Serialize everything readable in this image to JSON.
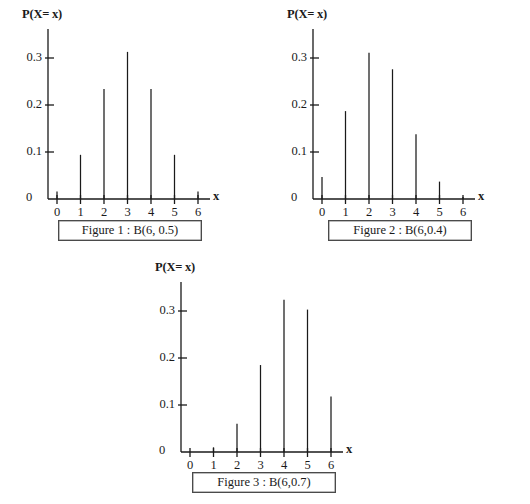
{
  "page": {
    "width": 530,
    "height": 504,
    "background": "#ffffff",
    "ink_color": "#1a1a1a"
  },
  "axis_common": {
    "y_axis_title": "P(X= x)",
    "x_axis_title": "x",
    "origin_label": "0",
    "y_tick_labels": [
      "0.1",
      "0.2",
      "0.3"
    ],
    "y_tick_values": [
      0.1,
      0.2,
      0.3
    ],
    "x_tick_labels": [
      "0",
      "1",
      "2",
      "3",
      "4",
      "5",
      "6"
    ],
    "ylim": [
      0,
      0.355
    ],
    "xlim": [
      -0.55,
      6.8
    ]
  },
  "figures": [
    {
      "id": "figure-1",
      "caption": "Figure 1 : B(6, 0.5)",
      "n": 6,
      "p": 0.5
    },
    {
      "id": "figure-2",
      "caption": "Figure 2 : B(6,0.4)",
      "n": 6,
      "p": 0.4
    },
    {
      "id": "figure-3",
      "caption": "Figure 3 : B(6,0.7)",
      "n": 6,
      "p": 0.7
    }
  ],
  "chart_data": [
    {
      "type": "bar",
      "id": "figure-1",
      "title": "Figure 1 : B(6, 0.5)",
      "xlabel": "x",
      "ylabel": "P(X= x)",
      "categories": [
        "0",
        "1",
        "2",
        "3",
        "4",
        "5",
        "6"
      ],
      "x": [
        0,
        1,
        2,
        3,
        4,
        5,
        6
      ],
      "values": [
        0.016,
        0.094,
        0.234,
        0.313,
        0.234,
        0.094,
        0.016
      ],
      "ylim": [
        0,
        0.355
      ],
      "yticks": [
        0.1,
        0.2,
        0.3
      ],
      "grid": false,
      "legend": "none"
    },
    {
      "type": "bar",
      "id": "figure-2",
      "title": "Figure 2 : B(6,0.4)",
      "xlabel": "x",
      "ylabel": "P(X= x)",
      "categories": [
        "0",
        "1",
        "2",
        "3",
        "4",
        "5",
        "6"
      ],
      "x": [
        0,
        1,
        2,
        3,
        4,
        5,
        6
      ],
      "values": [
        0.047,
        0.187,
        0.311,
        0.276,
        0.138,
        0.037,
        0.004
      ],
      "ylim": [
        0,
        0.355
      ],
      "yticks": [
        0.1,
        0.2,
        0.3
      ],
      "grid": false,
      "legend": "none"
    },
    {
      "type": "bar",
      "id": "figure-3",
      "title": "Figure 3 : B(6,0.7)",
      "xlabel": "x",
      "ylabel": "P(X= x)",
      "categories": [
        "0",
        "1",
        "2",
        "3",
        "4",
        "5",
        "6"
      ],
      "x": [
        0,
        1,
        2,
        3,
        4,
        5,
        6
      ],
      "values": [
        0.001,
        0.01,
        0.06,
        0.185,
        0.324,
        0.303,
        0.118
      ],
      "ylim": [
        0,
        0.355
      ],
      "yticks": [
        0.1,
        0.2,
        0.3
      ],
      "grid": false,
      "legend": "none"
    }
  ]
}
